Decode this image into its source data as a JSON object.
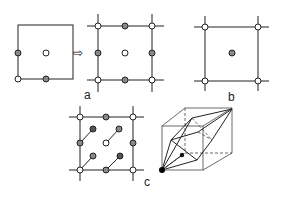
{
  "panels": {
    "a": {
      "label": "a"
    },
    "b": {
      "label": "b"
    },
    "c": {
      "label": "c"
    }
  },
  "arrow": {
    "symbol": "⇨"
  },
  "legend_markers": {
    "open": "open-circle-lattice-point",
    "hatched": "hatched-circle-lattice-point",
    "dark": "dark-circle-lattice-point",
    "solid": "solid-black-origin-point"
  },
  "colors": {
    "line": "#222222",
    "hatched": "#888888",
    "dark": "#555555",
    "background": "#ffffff"
  }
}
